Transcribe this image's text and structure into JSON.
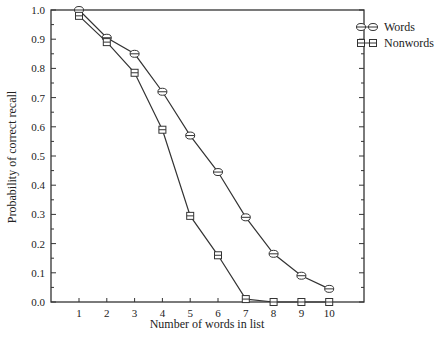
{
  "chart_data": {
    "type": "line",
    "title": "",
    "xlabel": "Number of words in list",
    "ylabel": "Probability of correct recall",
    "x": [
      1,
      2,
      3,
      4,
      5,
      6,
      7,
      8,
      9,
      10
    ],
    "series": [
      {
        "name": "Words",
        "marker": "circle",
        "values": [
          1.0,
          0.905,
          0.85,
          0.72,
          0.57,
          0.445,
          0.29,
          0.165,
          0.09,
          0.045
        ]
      },
      {
        "name": "Nonwords",
        "marker": "square",
        "values": [
          0.98,
          0.89,
          0.785,
          0.59,
          0.295,
          0.16,
          0.01,
          0.0,
          0.0,
          0.0
        ]
      }
    ],
    "xlim": [
      0,
      11
    ],
    "ylim": [
      0.0,
      1.0
    ],
    "xticks": [
      "1",
      "2",
      "3",
      "4",
      "5",
      "6",
      "7",
      "8",
      "9",
      "10"
    ],
    "yticks": [
      "0.0",
      "0.1",
      "0.2",
      "0.3",
      "0.4",
      "0.5",
      "0.6",
      "0.7",
      "0.8",
      "0.9",
      "1.0"
    ],
    "grid": false,
    "legend_position": "right-top-outside"
  },
  "colors": {
    "line": "#333333",
    "background": "#ffffff"
  }
}
